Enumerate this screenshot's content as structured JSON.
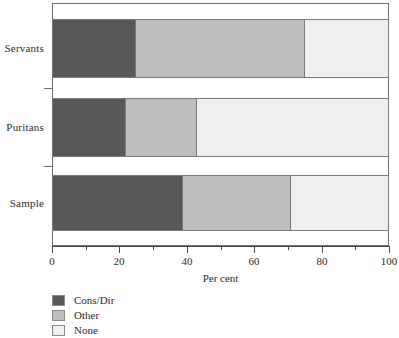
{
  "chart_data": {
    "type": "bar",
    "orientation": "horizontal",
    "stacked": true,
    "title": "",
    "subtitle": "",
    "xlabel": "Per cent",
    "ylabel": "",
    "xlim": [
      0,
      100
    ],
    "xticks": [
      0,
      20,
      40,
      60,
      80,
      100
    ],
    "xtick_labels": [
      "0",
      "20",
      "40",
      "60",
      "80",
      "100"
    ],
    "xminor_ticks": [
      10,
      30,
      50,
      70,
      90
    ],
    "grid": false,
    "legend_position": "below-left",
    "categories": [
      "Servants",
      "Puritans",
      "Sample"
    ],
    "series": [
      {
        "name": "Cons/Dir",
        "color": "#58585a",
        "values": [
          25,
          22,
          39
        ]
      },
      {
        "name": "Other",
        "color": "#bdbdbd",
        "values": [
          50,
          21,
          32
        ]
      },
      {
        "name": "None",
        "color": "#efefef",
        "values": [
          25,
          57,
          29
        ]
      }
    ],
    "annotations": []
  },
  "axis": {
    "xlabel": "Per cent",
    "tick_labels": [
      "0",
      "20",
      "40",
      "60",
      "80",
      "100"
    ],
    "category_labels": [
      "Servants",
      "Puritans",
      "Sample"
    ]
  },
  "legend": {
    "items": [
      {
        "label": "Cons/Dir",
        "color": "#58585a"
      },
      {
        "label": "Other",
        "color": "#bdbdbd"
      },
      {
        "label": "None",
        "color": "#efefef"
      }
    ]
  },
  "colors": {
    "cons_dir": "#58585a",
    "other": "#bdbdbd",
    "none": "#efefef",
    "frame": "#6e6e6e",
    "text": "#2b2b2b",
    "background": "#ffffff"
  }
}
